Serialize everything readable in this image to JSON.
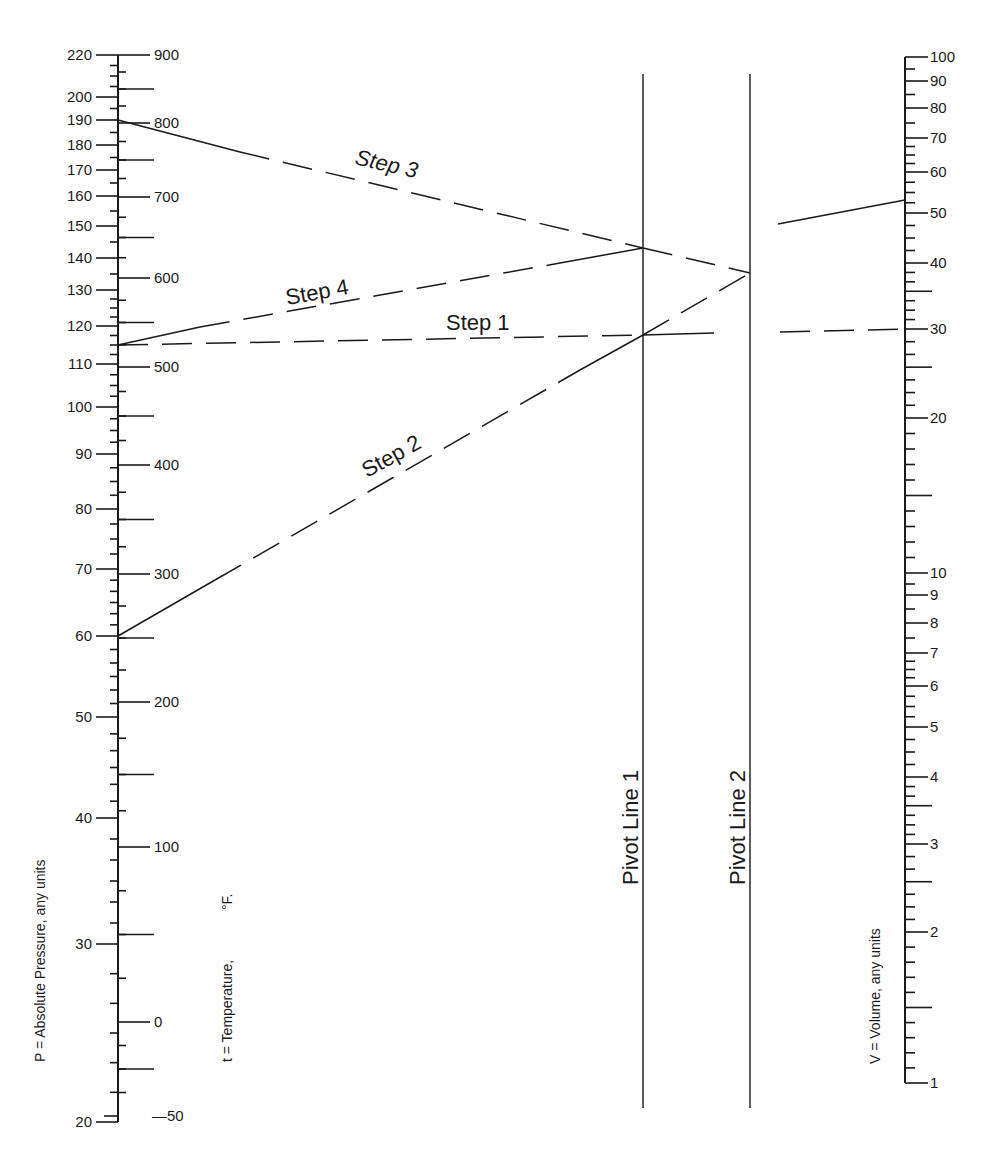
{
  "chart_data": {
    "type": "nomogram",
    "title": "",
    "axes": {
      "pressure": {
        "title": "P = Absolute Pressure, any units",
        "scale": "log",
        "range": [
          20,
          220
        ],
        "tick_labels": [
          "220",
          "200",
          "190",
          "180",
          "170",
          "160",
          "150",
          "140",
          "130",
          "120",
          "110",
          "100",
          "90",
          "80",
          "70",
          "60",
          "50",
          "40",
          "30",
          "20"
        ],
        "tick_values": [
          220,
          200,
          190,
          180,
          170,
          160,
          150,
          140,
          130,
          120,
          110,
          100,
          90,
          80,
          70,
          60,
          50,
          40,
          30,
          20
        ],
        "tick_y": [
          55,
          97,
          120,
          145,
          170,
          196,
          226,
          258,
          290,
          326,
          364,
          407,
          454,
          509,
          569,
          636,
          717,
          818,
          944,
          1122
        ]
      },
      "temperature": {
        "title": "t = Temperature, °F.",
        "range": [
          -50,
          900
        ],
        "tick_labels": [
          "900",
          "800",
          "700",
          "600",
          "500",
          "400",
          "300",
          "200",
          "100",
          "0",
          "—50"
        ],
        "tick_values": [
          900,
          800,
          700,
          600,
          500,
          400,
          300,
          200,
          100,
          0,
          -50
        ],
        "tick_y": [
          55,
          123,
          197,
          278,
          367,
          465,
          574,
          702,
          847,
          1022,
          1116
        ]
      },
      "volume": {
        "title": "V = Volume, any units",
        "scale": "log",
        "range": [
          1,
          100
        ],
        "tick_labels": [
          "100",
          "90",
          "80",
          "70",
          "60",
          "50",
          "40",
          "30",
          "20",
          "10",
          "9",
          "8",
          "7",
          "6",
          "5",
          "4",
          "3",
          "2",
          "1"
        ],
        "tick_values": [
          100,
          90,
          80,
          70,
          60,
          50,
          40,
          30,
          20,
          10,
          9,
          8,
          7,
          6,
          5,
          4,
          3,
          2,
          1
        ],
        "tick_y": [
          57,
          81,
          108,
          138,
          172,
          213,
          263,
          329,
          418,
          573,
          595,
          623,
          653,
          686,
          727,
          777,
          844,
          932,
          1083
        ]
      }
    },
    "pivot_lines": [
      {
        "label": "Pivot Line 1",
        "x": 643
      },
      {
        "label": "Pivot Line 2",
        "x": 750
      }
    ],
    "steps": [
      {
        "label": "Step 1",
        "from": {
          "axis": "pressure",
          "value": 115
        },
        "to": {
          "axis": "volume",
          "value": 30
        },
        "through": "Pivot Line 1"
      },
      {
        "label": "Step 2",
        "from": {
          "axis": "pressure",
          "value": 60
        },
        "through": "Pivot Line 1",
        "to": "Pivot Line 2"
      },
      {
        "label": "Step 3",
        "from": {
          "axis": "pressure",
          "value": 190
        },
        "through": "Pivot Line 1",
        "to": "Pivot Line 2"
      },
      {
        "label": "Step 4",
        "from": {
          "axis": "pressure",
          "value": 115
        },
        "to": "Pivot Line 1"
      }
    ],
    "result": {
      "from": "Pivot Line 2",
      "to": {
        "axis": "volume",
        "value": 53
      }
    },
    "grid": false,
    "legend": null
  },
  "labels": {
    "pressure_title": "P = Absolute Pressure, any units",
    "temperature_title": "t = Temperature,",
    "temperature_unit": "°F.",
    "volume_title": "V = Volume, any units",
    "pivot1": "Pivot Line 1",
    "pivot2": "Pivot Line 2",
    "step1": "Step 1",
    "step2": "Step 2",
    "step3": "Step 3",
    "step4": "Step 4"
  },
  "colors": {
    "ink": "#1a1a1a",
    "background": "#ffffff"
  }
}
